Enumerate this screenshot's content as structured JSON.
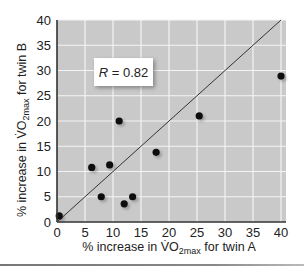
{
  "chart_data": {
    "type": "scatter",
    "title": "",
    "xlabel": "% increase in V̇O2max for twin A",
    "ylabel": "% increase in V̇O2max for twin B",
    "xlabel_parts": {
      "pre": "% increase in V̇O",
      "sub": "2max",
      "post": " for twin A"
    },
    "ylabel_parts": {
      "pre": "% increase in V̇O",
      "sub": "2max",
      "post": " for twin B"
    },
    "xlim": [
      0,
      40
    ],
    "ylim": [
      0,
      40
    ],
    "xticks": [
      0,
      5,
      10,
      15,
      20,
      25,
      30,
      35,
      40
    ],
    "yticks": [
      0,
      5,
      10,
      15,
      20,
      25,
      30,
      35,
      40
    ],
    "grid": true,
    "identity_line": {
      "from": [
        0,
        0
      ],
      "to": [
        40,
        40
      ]
    },
    "annotation": {
      "text": "R = 0.82",
      "R_symbol": "R",
      "R_value": " = 0.82"
    },
    "points": [
      {
        "x": 0.4,
        "y": 1.2
      },
      {
        "x": 6.2,
        "y": 10.8
      },
      {
        "x": 9.4,
        "y": 11.3
      },
      {
        "x": 7.9,
        "y": 5.0
      },
      {
        "x": 12.0,
        "y": 3.6
      },
      {
        "x": 13.5,
        "y": 5.0
      },
      {
        "x": 11.1,
        "y": 20.0
      },
      {
        "x": 17.7,
        "y": 13.8
      },
      {
        "x": 25.4,
        "y": 21.0
      },
      {
        "x": 40.0,
        "y": 28.9
      }
    ],
    "colors": {
      "plot_bg": "#c9c9c9",
      "grid": "#f4f4f4",
      "point": "#111111",
      "line": "#333333",
      "axis": "#333333"
    }
  }
}
